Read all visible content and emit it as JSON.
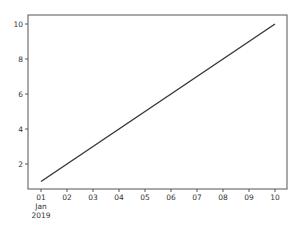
{
  "chart_data": {
    "type": "line",
    "title": "",
    "xlabel": "",
    "ylabel": "",
    "x": [
      "2019-01-01",
      "2019-01-02",
      "2019-01-03",
      "2019-01-04",
      "2019-01-05",
      "2019-01-06",
      "2019-01-07",
      "2019-01-08",
      "2019-01-09",
      "2019-01-10"
    ],
    "x_tick_labels": [
      "01",
      "02",
      "03",
      "04",
      "05",
      "06",
      "07",
      "08",
      "09",
      "10"
    ],
    "x_tick_sublabel": [
      "Jan",
      "2019"
    ],
    "y_ticks": [
      2,
      4,
      6,
      8,
      10
    ],
    "ylim": [
      0.55,
      10.45
    ],
    "grid": false,
    "legend": null,
    "series": [
      {
        "name": "",
        "values": [
          1,
          2,
          3,
          4,
          5,
          6,
          7,
          8,
          9,
          10
        ],
        "color": "#3a3a3a"
      }
    ]
  },
  "style": {
    "line_color": "#3a3a3a",
    "spine_color": "#555555",
    "text_color": "#333333"
  }
}
